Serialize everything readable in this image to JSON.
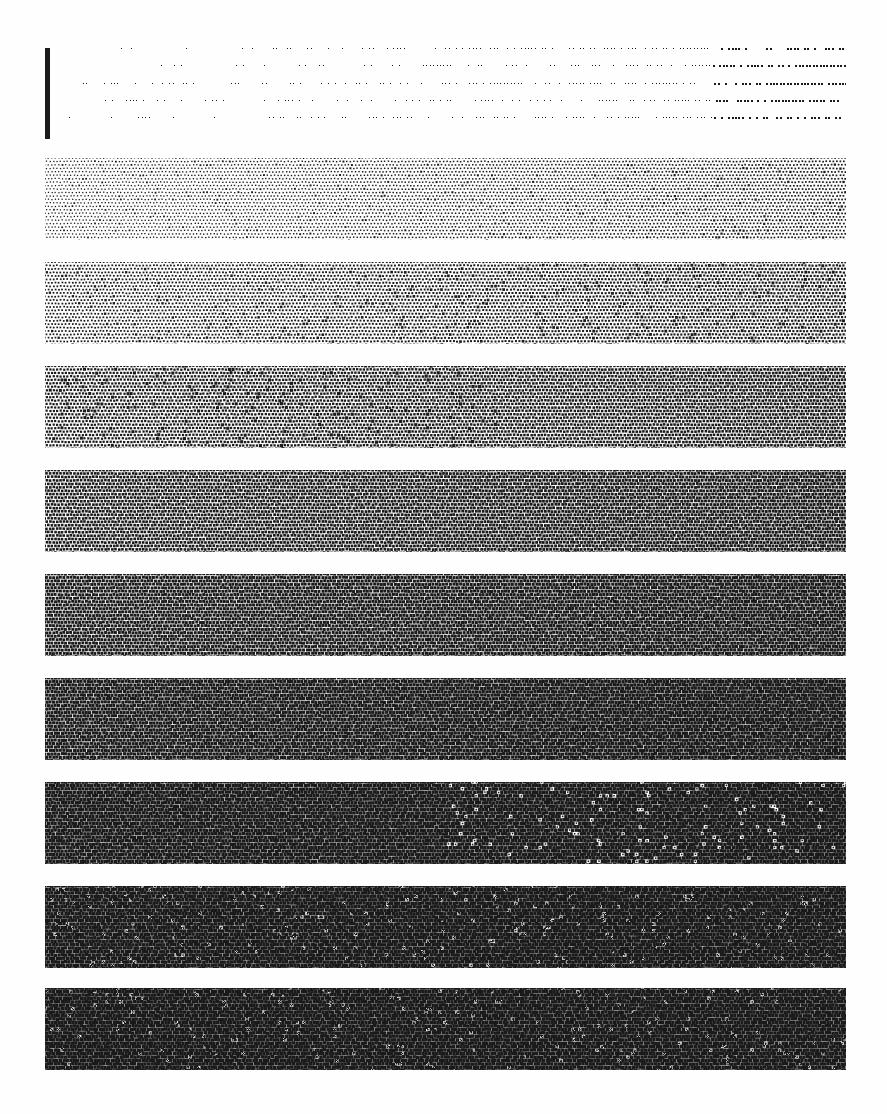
{
  "page": {
    "width": 887,
    "height": 1114,
    "background_color": "#fefefe",
    "ink_color": "#1a1a1a"
  },
  "registration_bar": {
    "label": "registration bar",
    "x": 45,
    "y": 48,
    "width": 5,
    "height": 91,
    "color": "#1c1c1c"
  },
  "bands": {
    "count": 10,
    "left": 45,
    "right": 846,
    "width": 801,
    "height": 82,
    "gap": 20,
    "pitch": 102.4,
    "first_top": 48,
    "cell_pitch": 3.45,
    "gradient_note": "each band ramps left-to-right from its start density to its end density",
    "items": [
      {
        "index": 1,
        "label": "band-1",
        "top": 48,
        "start_density": 0.012,
        "end_density": 0.085,
        "dot_min_px": 1.0,
        "dot_max_px": 1.6,
        "sparse": true,
        "pattern": "sparse-dot",
        "tone_label": "5%"
      },
      {
        "index": 2,
        "label": "band-2",
        "top": 158,
        "start_density": 0.12,
        "end_density": 0.22,
        "dot_min_px": 1.3,
        "dot_max_px": 1.9,
        "sparse": false,
        "pattern": "halftone",
        "tone_label": "15%"
      },
      {
        "index": 3,
        "label": "band-3",
        "top": 262,
        "start_density": 0.22,
        "end_density": 0.36,
        "dot_min_px": 1.6,
        "dot_max_px": 2.1,
        "sparse": false,
        "pattern": "halftone",
        "tone_label": "25%"
      },
      {
        "index": 4,
        "label": "band-4",
        "top": 366,
        "start_density": 0.36,
        "end_density": 0.52,
        "dot_min_px": 1.9,
        "dot_max_px": 2.4,
        "sparse": false,
        "pattern": "halftone",
        "tone_label": "40%"
      },
      {
        "index": 5,
        "label": "band-5",
        "top": 470,
        "start_density": 0.5,
        "end_density": 0.64,
        "dot_min_px": 2.2,
        "dot_max_px": 2.6,
        "sparse": false,
        "pattern": "halftone",
        "tone_label": "55%"
      },
      {
        "index": 6,
        "label": "band-6",
        "top": 574,
        "start_density": 0.62,
        "end_density": 0.74,
        "dot_min_px": 2.5,
        "dot_max_px": 2.8,
        "sparse": false,
        "pattern": "halftone",
        "tone_label": "68%"
      },
      {
        "index": 7,
        "label": "band-7",
        "top": 678,
        "start_density": 0.72,
        "end_density": 0.83,
        "dot_min_px": 2.7,
        "dot_max_px": 3.0,
        "sparse": false,
        "pattern": "halftone",
        "tone_label": "78%"
      },
      {
        "index": 8,
        "label": "band-8",
        "top": 782,
        "start_density": 0.82,
        "end_density": 0.9,
        "dot_min_px": 2.9,
        "dot_max_px": 3.15,
        "sparse": false,
        "pattern": "halftone",
        "tone_label": "86%"
      },
      {
        "index": 9,
        "label": "band-9",
        "top": 886,
        "start_density": 0.89,
        "end_density": 0.945,
        "dot_min_px": 3.05,
        "dot_max_px": 3.28,
        "sparse": false,
        "pattern": "halftone",
        "tone_label": "92%"
      },
      {
        "index": 10,
        "label": "band-10",
        "top": 988,
        "start_density": 0.955,
        "end_density": 0.985,
        "dot_min_px": 3.2,
        "dot_max_px": 3.4,
        "sparse": false,
        "pattern": "halftone",
        "tone_label": "97%"
      }
    ]
  }
}
